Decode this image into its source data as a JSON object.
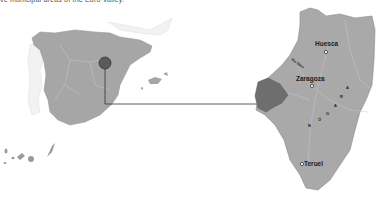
{
  "caption": "ve municipal areas of the Ebro Valley.",
  "colors": {
    "land": "#a6a6a6",
    "land_dark": "#8c8c8c",
    "highlight": "#6e6e6e",
    "neighbor": "#e8e8e8",
    "border": "#c8c8c8",
    "marker": "#5a5a5a",
    "line": "#333333"
  },
  "overview_map": {
    "region": "Spain",
    "marker": {
      "cx": 105,
      "cy": 63,
      "r": 6
    }
  },
  "detail_map": {
    "region": "Aragon",
    "labels": {
      "huesca": "Huesca",
      "zaragoza": "Zaragoza",
      "teruel": "Teruel",
      "river": "Río Ebro",
      "region_name": "ARAGÓN"
    }
  },
  "connector": {
    "from": [
      105,
      69
    ],
    "corner": [
      105,
      104
    ],
    "to": [
      272,
      104
    ]
  }
}
